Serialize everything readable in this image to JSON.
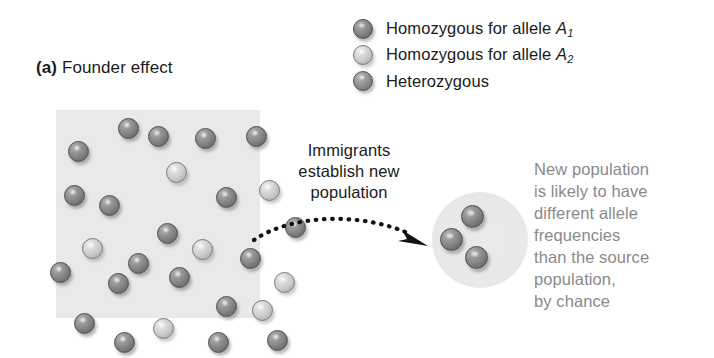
{
  "panel": {
    "label": "(a)",
    "title": "Founder effect"
  },
  "legend": {
    "items": [
      {
        "marker": "sphere-dark",
        "shade": "dark",
        "text_before": "Homozygous for allele ",
        "allele": "A",
        "subscript": "1"
      },
      {
        "marker": "sphere-light",
        "shade": "light",
        "text_before": "Homozygous for allele ",
        "allele": "A",
        "subscript": "2"
      },
      {
        "marker": "sphere-mid",
        "shade": "mid",
        "text_before": "Heterozygous",
        "allele": "",
        "subscript": ""
      }
    ]
  },
  "source_population": {
    "spheres": [
      {
        "x": 62,
        "y": 8,
        "shade": "dark"
      },
      {
        "x": 92,
        "y": 16,
        "shade": "dark"
      },
      {
        "x": 139,
        "y": 18,
        "shade": "dark"
      },
      {
        "x": 190,
        "y": 16,
        "shade": "dark"
      },
      {
        "x": 12,
        "y": 31,
        "shade": "dark"
      },
      {
        "x": 110,
        "y": 52,
        "shade": "light"
      },
      {
        "x": 8,
        "y": 75,
        "shade": "dark"
      },
      {
        "x": 43,
        "y": 85,
        "shade": "dark"
      },
      {
        "x": 160,
        "y": 77,
        "shade": "dark"
      },
      {
        "x": 203,
        "y": 70,
        "shade": "light"
      },
      {
        "x": 101,
        "y": 113,
        "shade": "dark"
      },
      {
        "x": 229,
        "y": 107,
        "shade": "dark"
      },
      {
        "x": 26,
        "y": 128,
        "shade": "light"
      },
      {
        "x": 136,
        "y": 129,
        "shade": "light"
      },
      {
        "x": 72,
        "y": 143,
        "shade": "dark"
      },
      {
        "x": 184,
        "y": 138,
        "shade": "dark"
      },
      {
        "x": -6,
        "y": 152,
        "shade": "dark"
      },
      {
        "x": 52,
        "y": 163,
        "shade": "dark"
      },
      {
        "x": 113,
        "y": 157,
        "shade": "dark"
      },
      {
        "x": 218,
        "y": 162,
        "shade": "light"
      },
      {
        "x": 160,
        "y": 186,
        "shade": "dark"
      },
      {
        "x": 196,
        "y": 190,
        "shade": "light"
      },
      {
        "x": 18,
        "y": 203,
        "shade": "dark"
      },
      {
        "x": 97,
        "y": 208,
        "shade": "light"
      },
      {
        "x": 58,
        "y": 222,
        "shade": "dark"
      },
      {
        "x": 152,
        "y": 222,
        "shade": "dark"
      },
      {
        "x": 211,
        "y": 220,
        "shade": "dark"
      },
      {
        "x": 126,
        "y": 250,
        "shade": "dark"
      }
    ]
  },
  "immigrants_caption": {
    "lines": [
      "Immigrants",
      "establish new",
      "population"
    ]
  },
  "arrow": {
    "name": "dotted-migration-arrow",
    "style": "dotted-curved-with-arrowhead"
  },
  "new_population": {
    "spheres": [
      {
        "x": 29,
        "y": 13,
        "shade": "dark"
      },
      {
        "x": 8,
        "y": 36,
        "shade": "dark"
      },
      {
        "x": 33,
        "y": 54,
        "shade": "dark"
      }
    ]
  },
  "result_text": {
    "lines": [
      "New population",
      "is likely to have",
      "different allele",
      "frequencies",
      "than the source",
      "population,",
      "by chance"
    ]
  },
  "colors": {
    "background": "#ffffff",
    "population_box": "#e9e9e9",
    "new_population_circle": "#e8e8e8",
    "primary_text": "#1b1b1b",
    "secondary_text": "#8a8a8a",
    "sphere_dark": "#848484",
    "sphere_light": "#cacaca",
    "sphere_mid": "#8d8d8d"
  }
}
